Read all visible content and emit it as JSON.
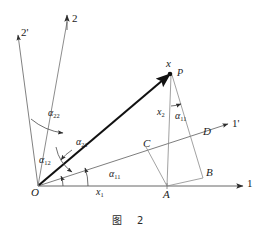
{
  "figure": {
    "caption": "图  2",
    "caption_cn": "图",
    "caption_number": "2",
    "background_color": "#ffffff",
    "line_color": "#3a3a3a",
    "vector_color": "#111111",
    "text_color": "#1b1b1b"
  },
  "axes": [
    {
      "id": "axis-1",
      "label": "1",
      "label_plain": "1",
      "kind": "primary",
      "direction_deg": 0,
      "arrow": true
    },
    {
      "id": "axis-2",
      "label": "2",
      "label_plain": "2",
      "kind": "primary",
      "direction_deg": 90,
      "arrow": true
    },
    {
      "id": "axis-1p",
      "label": "1'",
      "label_plain": "1'",
      "kind": "rotated",
      "direction_deg": 18,
      "arrow": true
    },
    {
      "id": "axis-2p",
      "label": "2'",
      "label_plain": "2'",
      "kind": "rotated",
      "direction_deg": 107,
      "arrow": true
    }
  ],
  "points": [
    {
      "id": "point-O",
      "label": "O",
      "role": "origin"
    },
    {
      "id": "point-x",
      "label": "x",
      "role": "vector-tip"
    },
    {
      "id": "point-P",
      "label": "P",
      "role": "vector-tip-name"
    },
    {
      "id": "point-A",
      "label": "A",
      "role": "foot-on-axis-1"
    },
    {
      "id": "point-B",
      "label": "B",
      "role": "projection-corner"
    },
    {
      "id": "point-C",
      "label": "C",
      "role": "intersection-on-axis-1p"
    },
    {
      "id": "point-D",
      "label": "D",
      "role": "foot-on-axis-1p"
    }
  ],
  "components": [
    {
      "id": "component-x1",
      "label_base": "x",
      "label_sub": "1",
      "label_plain": "x1",
      "description": "component along axis 1"
    },
    {
      "id": "component-x2",
      "label_base": "x",
      "label_sub": "2",
      "label_plain": "x2",
      "description": "component along axis 2"
    }
  ],
  "angles": [
    {
      "id": "angle-a11",
      "symbol": "α",
      "sub": "11",
      "label_plain": "α11",
      "location": "between axis 1 and axis 1' at origin"
    },
    {
      "id": "angle-a11-top",
      "symbol": "α",
      "sub": "11",
      "label_plain": "α11",
      "location": "at P between vertical and PD"
    },
    {
      "id": "angle-a12",
      "symbol": "α",
      "sub": "12",
      "label_plain": "α12",
      "location": "between axis 2' and axis 1' at origin"
    },
    {
      "id": "angle-a21",
      "symbol": "α",
      "sub": "21",
      "label_plain": "α21",
      "location": "between axis 1' and axis 2 at origin"
    },
    {
      "id": "angle-a22",
      "symbol": "α",
      "sub": "22",
      "label_plain": "α22",
      "location": "between axis 2' and axis 2"
    }
  ]
}
